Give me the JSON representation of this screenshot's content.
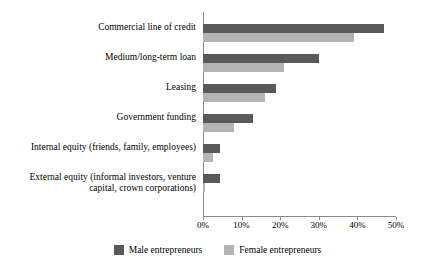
{
  "chart_data": {
    "type": "bar",
    "orientation": "horizontal",
    "title": "",
    "xlabel": "",
    "ylabel": "",
    "xlim": [
      0,
      50
    ],
    "grid": false,
    "legend_position": "bottom-center",
    "xticks": [
      "0%",
      "10%",
      "20%",
      "30%",
      "40%",
      "50%"
    ],
    "xtick_values": [
      0,
      10,
      20,
      30,
      40,
      50
    ],
    "categories": [
      "Commercial line of credit",
      "Medium/long-term loan",
      "Leasing",
      "Government funding",
      "Internal equity (friends, family, employees)",
      "External equity (informal investors, venture capital, crown corporations)"
    ],
    "series": [
      {
        "name": "Male entrepreneurs",
        "color": "#595959",
        "values": [
          47,
          30,
          19,
          13,
          4.5,
          4.5
        ]
      },
      {
        "name": "Female entrepreneurs",
        "color": "#b4b4b4",
        "values": [
          39,
          21,
          16,
          8,
          2.5,
          0.5
        ]
      }
    ]
  },
  "legend": {
    "items": [
      {
        "label": "Male entrepreneurs",
        "color": "#595959"
      },
      {
        "label": "Female entrepreneurs",
        "color": "#b4b4b4"
      }
    ]
  },
  "axis": {
    "line_color": "#8a8a8a"
  }
}
